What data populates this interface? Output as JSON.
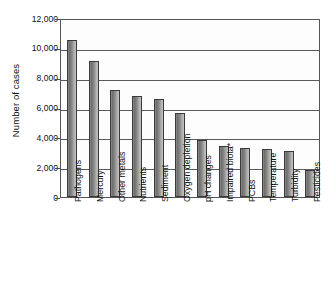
{
  "chart_data": {
    "type": "bar",
    "title": "",
    "subtitle": "",
    "xlabel": "",
    "ylabel": "Number of cases",
    "ylim": [
      0,
      12000
    ],
    "ytick_interval": 2000,
    "ytick_labels": [
      "12,000",
      "10,000",
      "8,000",
      "6,000",
      "4,000",
      "2,000",
      "0"
    ],
    "ytick_values": [
      12000,
      10000,
      8000,
      6000,
      4000,
      2000,
      0
    ],
    "grid": true,
    "grid_axis": "y",
    "legend": false,
    "legend_position": "none",
    "orientation": "vertical",
    "xtick_rotation": -90,
    "categories": [
      "Pathogens",
      "Mercury",
      "Other metals",
      "Nutrients",
      "Sediment",
      "Oxygen depletion",
      "pH changes",
      "Impaired biota*",
      "PCBs",
      "Temperature",
      "Turbidity",
      "Pesticides"
    ],
    "values": [
      10500,
      9150,
      7200,
      6800,
      6550,
      5650,
      3850,
      3450,
      3300,
      3200,
      3100,
      1800
    ],
    "annotations": [
      "* Impaired biota"
    ],
    "colors": {
      "bar_fill_dark": "#6f6f6f",
      "bar_fill_light": "#c2c2c2",
      "bar_outline": "#3a3a3a",
      "gridline": "#5a5a5a",
      "axis": "#555555",
      "plot_background": "#fdfdfd",
      "text": "#111111"
    }
  }
}
